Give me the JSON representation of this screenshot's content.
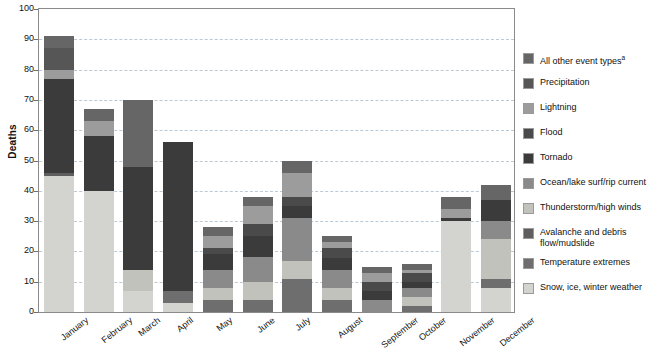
{
  "chart_data": {
    "type": "bar",
    "subtype": "stacked-vertical",
    "title": "",
    "xlabel": "",
    "ylabel": "Deaths",
    "ylim": [
      0,
      100
    ],
    "ytick_values": [
      0,
      10,
      20,
      30,
      40,
      50,
      60,
      70,
      80,
      90,
      100
    ],
    "ytick_labels": [
      "0",
      "10",
      "20",
      "30",
      "40",
      "50",
      "60",
      "70",
      "80",
      "90",
      "100"
    ],
    "grid": "horizontal-dashed",
    "legend_position": "right",
    "categories": [
      "January",
      "February",
      "March",
      "April",
      "May",
      "June",
      "July",
      "August",
      "September",
      "October",
      "November",
      "December"
    ],
    "series": [
      {
        "name": "Snow, ice, winter weather",
        "color": "#d3d3cf",
        "values": [
          45,
          40,
          7,
          3,
          0,
          0,
          0,
          0,
          0,
          0,
          30,
          8
        ]
      },
      {
        "name": "Temperature extremes",
        "color": "#6e6e6e",
        "values": [
          0,
          0,
          0,
          4,
          4,
          4,
          11,
          4,
          0,
          2,
          0,
          3
        ]
      },
      {
        "name": "Avalanche and debris flow/mudslide",
        "color": "#5e5e5e",
        "values": [
          1,
          0,
          0,
          0,
          0,
          0,
          0,
          0,
          0,
          0,
          0,
          0
        ]
      },
      {
        "name": "Thunderstorm/high winds",
        "color": "#c2c2bd",
        "values": [
          0,
          0,
          7,
          0,
          4,
          6,
          6,
          4,
          0,
          3,
          0,
          13
        ]
      },
      {
        "name": "Ocean/lake surf/rip current",
        "color": "#8a8a8a",
        "values": [
          0,
          0,
          0,
          0,
          6,
          8,
          14,
          6,
          4,
          3,
          0,
          6
        ]
      },
      {
        "name": "Tornado",
        "color": "#3b3b3b",
        "values": [
          31,
          18,
          34,
          49,
          5,
          7,
          4,
          4,
          3,
          2,
          1,
          7
        ]
      },
      {
        "name": "Flood",
        "color": "#4a4a4a",
        "values": [
          0,
          0,
          0,
          0,
          2,
          4,
          3,
          3,
          3,
          3,
          0,
          0
        ]
      },
      {
        "name": "Lightning",
        "color": "#9c9c9c",
        "values": [
          3,
          5,
          0,
          0,
          4,
          6,
          8,
          2,
          3,
          1,
          3,
          0
        ]
      },
      {
        "name": "Precipitation",
        "color": "#565656",
        "values": [
          7,
          0,
          0,
          0,
          0,
          0,
          0,
          0,
          0,
          0,
          0,
          0
        ]
      },
      {
        "name": "All other event types",
        "color": "#666666",
        "values": [
          4,
          4,
          22,
          0,
          3,
          3,
          4,
          2,
          2,
          2,
          4,
          5
        ]
      }
    ],
    "totals": [
      91,
      67,
      70,
      59,
      28,
      38,
      50,
      25,
      15,
      16,
      38,
      42
    ],
    "legend_entries": [
      {
        "label": "All other event types",
        "superscript": "a",
        "color": "#666666"
      },
      {
        "label": "Precipitation",
        "superscript": "",
        "color": "#565656"
      },
      {
        "label": "Lightning",
        "superscript": "",
        "color": "#9c9c9c"
      },
      {
        "label": "Flood",
        "superscript": "",
        "color": "#4a4a4a"
      },
      {
        "label": "Tornado",
        "superscript": "",
        "color": "#3b3b3b"
      },
      {
        "label": "Ocean/lake surf/rip current",
        "superscript": "",
        "color": "#8a8a8a"
      },
      {
        "label": "Thunderstorm/high winds",
        "superscript": "",
        "color": "#c2c2bd"
      },
      {
        "label": "Avalanche and debris\nflow/mudslide",
        "superscript": "",
        "color": "#5e5e5e"
      },
      {
        "label": "Temperature extremes",
        "superscript": "",
        "color": "#6e6e6e"
      },
      {
        "label": "Snow, ice, winter weather",
        "superscript": "",
        "color": "#d3d3cf"
      }
    ]
  }
}
